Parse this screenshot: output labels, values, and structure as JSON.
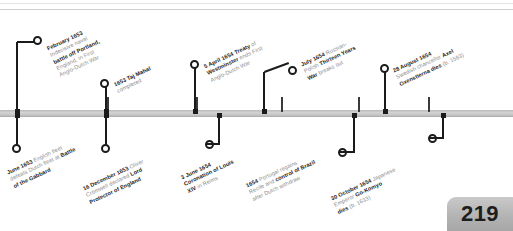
{
  "page": {
    "number": "219",
    "axis_label": "timeline-axis"
  },
  "events_above": [
    {
      "id": "february-1653-portland",
      "date": "February 1653",
      "text": "Indecisive naval battle off Portland, England, in First Anglo-Dutch War",
      "lines": [
        {
          "bold": "February 1653",
          "rest": ""
        },
        {
          "bold": "",
          "rest": "Indecisive naval"
        },
        {
          "bold": "battle off Portland,",
          "rest": ""
        },
        {
          "bold": "",
          "rest": "England, in First"
        },
        {
          "bold": "",
          "rest": "Anglo-Dutch War"
        }
      ]
    },
    {
      "id": "1653-taj-mahal",
      "date": "1653",
      "text": "Taj Mahal completed",
      "lines": [
        {
          "bold": "1653 Taj Mahal",
          "rest": ""
        },
        {
          "bold": "",
          "rest": "completed"
        }
      ]
    },
    {
      "id": "5-april-1654-westminster",
      "date": "5 April 1654",
      "text": "Treaty of Westminster ends First Anglo-Dutch War",
      "lines": [
        {
          "bold": "5 April 1654 Treaty",
          "rest": " of"
        },
        {
          "bold": "Westminster",
          "rest": " ends First"
        },
        {
          "bold": "",
          "rest": "Anglo-Dutch War"
        }
      ]
    },
    {
      "id": "july-1654-thirteen-years-war",
      "date": "July 1654",
      "text": "Russian-Polish Thirteen Years War breaks out",
      "lines": [
        {
          "bold": "July 1654",
          "rest": " Russian-"
        },
        {
          "bold": "",
          "rest": "Polish "
        },
        {
          "bold": "Thirteen Years",
          "rest": ""
        },
        {
          "bold": "War",
          "rest": " breaks out"
        }
      ]
    },
    {
      "id": "28-august-1654-oxenstierna",
      "date": "28 August 1654",
      "text": "Swedish chancellor Axel Oxenstierna dies (b. 1583)",
      "lines": [
        {
          "bold": "28 August 1654",
          "rest": ""
        },
        {
          "bold": "",
          "rest": "Swedish chancellor "
        },
        {
          "bold": "Axel",
          "rest": ""
        },
        {
          "bold": "Oxenstierna dies",
          "rest": " (b. 1583)"
        }
      ]
    }
  ],
  "events_below": [
    {
      "id": "june-1653-gabbard",
      "date": "June 1653",
      "text": "English fleet defeats Dutch fleet at Battle of the Gabbard",
      "lines": [
        {
          "bold": "June 1653",
          "rest": " English fleet"
        },
        {
          "bold": "",
          "rest": "defeats Dutch fleet at "
        },
        {
          "bold": "Battle",
          "rest": ""
        },
        {
          "bold": "of the Gabbard",
          "rest": ""
        }
      ]
    },
    {
      "id": "16-december-1653-cromwell",
      "date": "16 December 1653",
      "text": "Oliver Cromwell declared Lord Protector of England",
      "lines": [
        {
          "bold": "16 December 1653",
          "rest": " Oliver"
        },
        {
          "bold": "",
          "rest": "Cromwell declared "
        },
        {
          "bold": "Lord",
          "rest": ""
        },
        {
          "bold": "Protector of England",
          "rest": ""
        }
      ]
    },
    {
      "id": "3-june-1654-louis-xiv",
      "date": "3 June 1654",
      "text": "Coronation of Louis XIV in Reims",
      "lines": [
        {
          "bold": "3 June 1654",
          "rest": ""
        },
        {
          "bold": "Coronation of Louis",
          "rest": ""
        },
        {
          "bold": "XIV",
          "rest": " in Reims"
        }
      ]
    },
    {
      "id": "1654-portugal-brazil",
      "date": "1654",
      "text": "Portugal regains Recife and control of Brazil after Dutch withdraw",
      "lines": [
        {
          "bold": "1654",
          "rest": " Portugal regains"
        },
        {
          "bold": "",
          "rest": "Recife and "
        },
        {
          "bold": "control of Brazil",
          "rest": ""
        },
        {
          "bold": "",
          "rest": "after Dutch withdraw"
        }
      ]
    },
    {
      "id": "30-october-1654-go-komyo",
      "date": "30 October 1654",
      "text": "Japanese Emperor Go-Komyo dies (b. 1633)",
      "lines": [
        {
          "bold": "30 October 1654",
          "rest": " Japanese"
        },
        {
          "bold": "",
          "rest": "Emperor "
        },
        {
          "bold": "Go-Komyo",
          "rest": ""
        },
        {
          "bold": "dies",
          "rest": " (b. 1633)"
        }
      ]
    }
  ]
}
